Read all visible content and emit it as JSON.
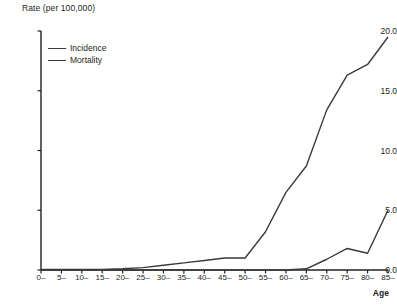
{
  "chart_data": {
    "type": "line",
    "title": "",
    "ylabel": "Rate (per 100,000)",
    "xlabel": "Age",
    "ylim": [
      0,
      20
    ],
    "yticks": [
      "0.0",
      "5.0",
      "10.0",
      "15.0",
      "20.0"
    ],
    "ytick_values": [
      0,
      5,
      10,
      15,
      20
    ],
    "grid": false,
    "legend_position": "top-left",
    "categories": [
      "0–",
      "5–",
      "10–",
      "15–",
      "20–",
      "25–",
      "30–",
      "35–",
      "40–",
      "45–",
      "50–",
      "55–",
      "60–",
      "65–",
      "70–",
      "75–",
      "80–",
      "85–"
    ],
    "series": [
      {
        "name": "Incidence",
        "color": "#3a3a3a",
        "values": [
          0.05,
          0.05,
          0.05,
          0.05,
          0.1,
          0.2,
          0.4,
          0.6,
          0.8,
          1.0,
          1.0,
          3.2,
          6.5,
          8.7,
          13.4,
          16.3,
          17.2,
          19.5
        ]
      },
      {
        "name": "Mortality",
        "color": "#3a3a3a",
        "values": [
          0.0,
          0.0,
          0.0,
          0.0,
          0.0,
          0.0,
          0.0,
          0.0,
          0.0,
          0.0,
          0.0,
          0.0,
          0.0,
          0.1,
          0.9,
          1.8,
          1.4,
          5.0
        ]
      }
    ]
  },
  "legend": {
    "items": [
      {
        "label": "Incidence"
      },
      {
        "label": "Mortality"
      }
    ]
  }
}
